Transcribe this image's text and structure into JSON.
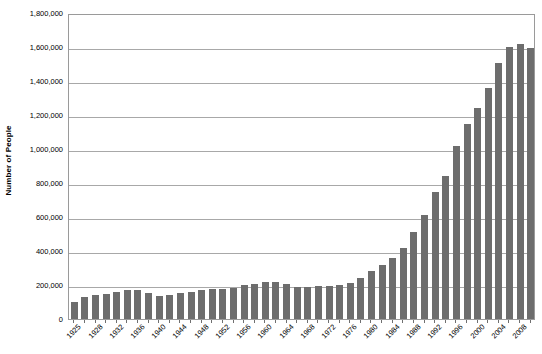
{
  "chart_data": {
    "type": "bar",
    "title": "",
    "subtitle": "",
    "xlabel": "",
    "ylabel": "Number of People",
    "ylim": [
      0,
      1800000
    ],
    "ytick_step": 200000,
    "ytick_labels": [
      "1,800,000",
      "1,600,000",
      "1,400,000",
      "1,200,000",
      "1,000,000",
      "800,000",
      "600,000",
      "400,000",
      "200,000",
      "0"
    ],
    "ytick_values": [
      1800000,
      1600000,
      1400000,
      1200000,
      1000000,
      800000,
      600000,
      400000,
      200000,
      0
    ],
    "grid": true,
    "legend": false,
    "legend_position": "none",
    "bar_color": "#6d6d6d",
    "plot_border_color": "#9a9a9a",
    "gridline_color": "#a8a8a8",
    "categories": [
      "1925",
      "1926",
      "1928",
      "1930",
      "1932",
      "1934",
      "1936",
      "1938",
      "1940",
      "1942",
      "1944",
      "1946",
      "1948",
      "1950",
      "1952",
      "1954",
      "1956",
      "1958",
      "1960",
      "1962",
      "1964",
      "1966",
      "1968",
      "1970",
      "1972",
      "1974",
      "1976",
      "1978",
      "1980",
      "1982",
      "1984",
      "1986",
      "1988",
      "1990",
      "1992",
      "1994",
      "1996",
      "1998",
      "2000",
      "2002",
      "2004",
      "2006",
      "2008",
      "2010"
    ],
    "visible_xtick_labels": [
      "1925",
      "1928",
      "1932",
      "1936",
      "1940",
      "1944",
      "1948",
      "1952",
      "1956",
      "1960",
      "1964",
      "1968",
      "1972",
      "1976",
      "1980",
      "1984",
      "1988",
      "1992",
      "1996",
      "2000",
      "2004",
      "2008"
    ],
    "values": [
      100000,
      128000,
      140000,
      150000,
      160000,
      168000,
      172000,
      152000,
      135000,
      142000,
      155000,
      160000,
      172000,
      175000,
      178000,
      182000,
      198000,
      206000,
      215000,
      218000,
      208000,
      186000,
      190000,
      192000,
      196000,
      200000,
      210000,
      240000,
      280000,
      320000,
      360000,
      420000,
      510000,
      610000,
      745000,
      840000,
      1020000,
      1145000,
      1240000,
      1360000,
      1505000,
      1600000,
      1615000,
      1595000
    ]
  }
}
